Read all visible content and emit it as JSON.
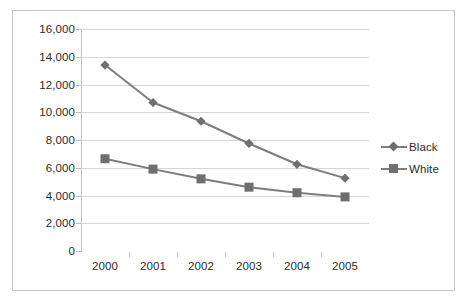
{
  "chart_data": {
    "type": "line",
    "title": "",
    "subtitle": "",
    "xlabel": "",
    "ylabel": "",
    "categories": [
      "2000",
      "2001",
      "2002",
      "2003",
      "2004",
      "2005"
    ],
    "series": [
      {
        "name": "Black",
        "marker": "diamond",
        "color": "#7d7d7d",
        "values": [
          13400,
          10700,
          9350,
          7750,
          6250,
          5250
        ]
      },
      {
        "name": "White",
        "marker": "square",
        "color": "#7d7d7d",
        "values": [
          6650,
          5900,
          5200,
          4600,
          4200,
          3900
        ]
      }
    ],
    "ylim": [
      0,
      16000
    ],
    "ytick_step": 2000,
    "ytick_labels": [
      "16,000",
      "14,000",
      "12,000",
      "10,000",
      "8,000",
      "6,000",
      "4,000",
      "2,000",
      "0"
    ],
    "ytick_values": [
      16000,
      14000,
      12000,
      10000,
      8000,
      6000,
      4000,
      2000,
      0
    ],
    "grid": "horizontal",
    "legend_position": "right",
    "legend_entries": [
      "Black",
      "White"
    ],
    "annotations": []
  },
  "colors": {
    "series_line": "#7d7d7d",
    "marker": "#6f6f6f",
    "gridline": "#d6d6d6",
    "axis": "#bdbdbd",
    "frame_border": "#c8c8c8",
    "text": "#2b2b2b",
    "background": "#ffffff"
  }
}
